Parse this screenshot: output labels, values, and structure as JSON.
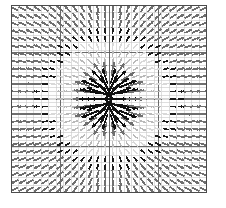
{
  "figure": {
    "title": "",
    "background": "#ffffff"
  },
  "chart_data": {
    "type": "quiver",
    "title": "",
    "subtitle": "",
    "xlabel": "",
    "ylabel": "",
    "xlim": [
      0,
      26
    ],
    "ylim": [
      0,
      25
    ],
    "xticklabels": [],
    "yticklabels": [],
    "grid": true,
    "legend": null,
    "annotations": [],
    "field": {
      "model": "radial-source",
      "center_x": 13.0,
      "center_y": 12.5,
      "nx": 26,
      "ny": 25,
      "cell_px": 7.54,
      "core_radius": 1.2,
      "max_arrow_px": 26,
      "min_arrow_px": 7,
      "anisotropy_x": 1.65,
      "anisotropy_y": 0.85
    },
    "colors": {
      "arrow_strong": "#111111",
      "arrow_mid": "#6f6f6f",
      "arrow_weak": "#b9b9b9",
      "arrow_faint": "#d8d8d8",
      "ring_dark": "#1a1a1a",
      "border": "#4c4c4c",
      "grid_major": "#5a5a5a",
      "grid_minor": "#c8c8c8"
    },
    "bands": [
      {
        "name": "inner-core",
        "radius_from": 0.0,
        "radius_to": 4.5,
        "color": "#111111",
        "note": "long black spokes radiating from centre"
      },
      {
        "name": "mid-field",
        "radius_from": 4.5,
        "radius_to": 8.0,
        "color": "#b9b9b9",
        "note": "short pale arrows forming the light square halo"
      },
      {
        "name": "ring",
        "radius_from": 8.0,
        "radius_to": 9.6,
        "color": "#1a1a1a",
        "note": "dark square ring of small arrows"
      },
      {
        "name": "outer-field",
        "radius_from": 9.6,
        "radius_to": 20.0,
        "color": "#6f6f6f",
        "note": "uniform medium-grey diagonal arrows filling the border region"
      }
    ],
    "grid_lines": {
      "major_x": [
        0,
        6.5,
        13,
        19.5,
        26
      ],
      "major_y": [
        0,
        6.25,
        12.5,
        18.75,
        25
      ],
      "minor_step": 1
    }
  }
}
